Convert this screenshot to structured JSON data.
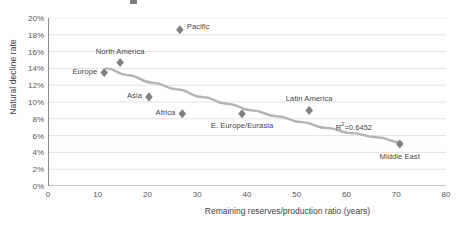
{
  "chart_data": {
    "type": "scatter",
    "title": "",
    "xlabel": "Remaining reserves/production ratio (years)",
    "ylabel": "Natural decline rate",
    "xlim": [
      0,
      80
    ],
    "ylim": [
      0,
      20
    ],
    "xticks": [
      0,
      10,
      20,
      30,
      40,
      50,
      60,
      70,
      80
    ],
    "xtick_labels": [
      "0",
      "10",
      "20",
      "30",
      "40",
      "50",
      "60",
      "70",
      "80"
    ],
    "yticks": [
      0,
      2,
      4,
      6,
      8,
      10,
      12,
      14,
      16,
      18,
      20
    ],
    "ytick_labels": [
      "0%",
      "2%",
      "4%",
      "6%",
      "8%",
      "10%",
      "12%",
      "14%",
      "16%",
      "18%",
      "20%"
    ],
    "grid": "horizontal",
    "legend": "none",
    "marker": "diamond",
    "marker_color": "#808080",
    "trendline_color": "#b3b3b3",
    "annotation": "R²=0.6452",
    "annotation_r2_value": 0.6452,
    "points": [
      {
        "name": "Pacific",
        "x": 26.5,
        "y": 18.6,
        "label_dx": 7,
        "label_dy": -3,
        "label_anchor": "left"
      },
      {
        "name": "North America",
        "x": 14.5,
        "y": 14.7,
        "label_dx": 0,
        "label_dy": -11,
        "label_anchor": "center"
      },
      {
        "name": "Europe",
        "x": 11.3,
        "y": 13.5,
        "label_dx": -7,
        "label_dy": -1,
        "label_anchor": "right"
      },
      {
        "name": "Asia",
        "x": 20.3,
        "y": 10.6,
        "label_dx": -7,
        "label_dy": -1,
        "label_anchor": "right"
      },
      {
        "name": "Africa",
        "x": 27.0,
        "y": 8.6,
        "label_dx": -7,
        "label_dy": -1,
        "label_anchor": "right"
      },
      {
        "name": "E. Europe/Eurasia",
        "x": 39.0,
        "y": 8.6,
        "label_dx": 0,
        "label_dy": 12,
        "label_anchor": "center"
      },
      {
        "name": "Latin America",
        "x": 52.5,
        "y": 9.0,
        "label_dx": 0,
        "label_dy": -11,
        "label_anchor": "center"
      },
      {
        "name": "Middle East",
        "x": 70.7,
        "y": 5.0,
        "label_dx": 0,
        "label_dy": 13,
        "label_anchor": "center"
      }
    ],
    "trendline": {
      "type": "power",
      "points": [
        {
          "x": 11.7,
          "y": 14.0
        },
        {
          "x": 16.0,
          "y": 13.2
        },
        {
          "x": 21.0,
          "y": 12.3
        },
        {
          "x": 26.0,
          "y": 11.5
        },
        {
          "x": 31.0,
          "y": 10.6
        },
        {
          "x": 36.0,
          "y": 9.8
        },
        {
          "x": 41.0,
          "y": 9.0
        },
        {
          "x": 46.0,
          "y": 8.3
        },
        {
          "x": 51.0,
          "y": 7.6
        },
        {
          "x": 56.0,
          "y": 6.9
        },
        {
          "x": 61.0,
          "y": 6.3
        },
        {
          "x": 66.0,
          "y": 5.8
        },
        {
          "x": 71.0,
          "y": 5.2
        }
      ]
    },
    "annotation_pos": {
      "x": 61.5,
      "y": 7.1
    }
  }
}
